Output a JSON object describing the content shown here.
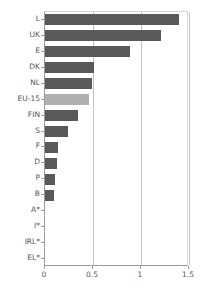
{
  "chart_data": {
    "type": "bar",
    "orientation": "horizontal",
    "title": "",
    "subtitle": "",
    "xlabel": "",
    "ylabel": "",
    "xlim": [
      0,
      1.5
    ],
    "xticks": [
      "0",
      "0.5",
      "1",
      "1.5"
    ],
    "xtick_values": [
      0,
      0.5,
      1,
      1.5
    ],
    "grid": true,
    "grid_axis": "x",
    "legend": false,
    "legend_position": "none",
    "categories": [
      "L",
      "UK",
      "E",
      "DK",
      "NL",
      "EU-15",
      "FIN",
      "S",
      "F",
      "D",
      "P",
      "B",
      "A*",
      "I*",
      "IRL*",
      "EL*"
    ],
    "values": [
      1.4,
      1.21,
      0.89,
      0.51,
      0.49,
      0.46,
      0.34,
      0.24,
      0.14,
      0.13,
      0.1,
      0.09,
      0,
      0,
      0,
      0
    ],
    "bars": [
      {
        "label": "L",
        "value": 1.4,
        "highlight": false
      },
      {
        "label": "UK",
        "value": 1.21,
        "highlight": false
      },
      {
        "label": "E",
        "value": 0.89,
        "highlight": false
      },
      {
        "label": "DK",
        "value": 0.51,
        "highlight": false
      },
      {
        "label": "NL",
        "value": 0.49,
        "highlight": false
      },
      {
        "label": "EU-15",
        "value": 0.46,
        "highlight": true
      },
      {
        "label": "FIN",
        "value": 0.34,
        "highlight": false
      },
      {
        "label": "S",
        "value": 0.24,
        "highlight": false
      },
      {
        "label": "F",
        "value": 0.14,
        "highlight": false
      },
      {
        "label": "D",
        "value": 0.13,
        "highlight": false
      },
      {
        "label": "P",
        "value": 0.1,
        "highlight": false
      },
      {
        "label": "B",
        "value": 0.09,
        "highlight": false
      },
      {
        "label": "A*",
        "value": 0.0,
        "highlight": false
      },
      {
        "label": "I*",
        "value": 0.0,
        "highlight": false
      },
      {
        "label": "IRL*",
        "value": 0.0,
        "highlight": false
      },
      {
        "label": "EL*",
        "value": 0.0,
        "highlight": false
      }
    ]
  },
  "colors": {
    "bar": "#595959",
    "bar_highlight": "#b0b0b0",
    "gridline": "#c2c2c2",
    "axis": "#9a9a9a",
    "text": "#555555",
    "background": "#ffffff"
  }
}
